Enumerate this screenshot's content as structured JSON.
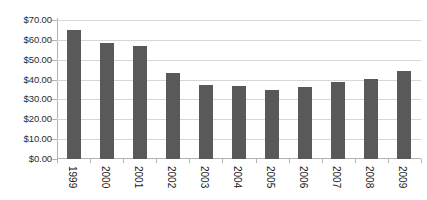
{
  "chart_data": {
    "type": "bar",
    "title": "",
    "subtitle": "",
    "xlabel": "",
    "ylabel": "",
    "categories": [
      "1999",
      "2000",
      "2001",
      "2002",
      "2003",
      "2004",
      "2005",
      "2006",
      "2007",
      "2008",
      "2009"
    ],
    "values": [
      64.8,
      58.5,
      57.0,
      43.5,
      37.5,
      36.6,
      35.0,
      36.3,
      38.6,
      40.1,
      44.1
    ],
    "series": [
      {
        "name": "",
        "values": [
          64.8,
          58.5,
          57.0,
          43.5,
          37.5,
          36.6,
          35.0,
          36.3,
          38.6,
          40.1,
          44.1
        ]
      }
    ],
    "ylim": [
      0,
      70
    ],
    "yticks": [
      0,
      10,
      20,
      30,
      40,
      50,
      60,
      70
    ],
    "ytick_labels": [
      "$0.00",
      "$10.00",
      "$20.00",
      "$30.00",
      "$40.00",
      "$50.00",
      "$60.00",
      "$70.00"
    ],
    "value_prefix": "$",
    "grid": true,
    "grid_axis": "y",
    "legend": false,
    "legend_position": "none",
    "bar_color": "#595959",
    "gridline_color": "#d6d6d6",
    "axis_color": "#b3b3b3",
    "background_color": "#ffffff",
    "xtick_label_rotation": 90
  }
}
